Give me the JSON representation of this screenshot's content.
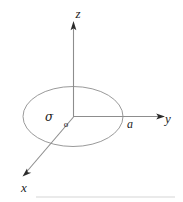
{
  "figure": {
    "background_color": "#ffffff",
    "line_color": "#8d8d8d",
    "outline_color": "#9a9a9a",
    "arrow_color": "#2b2b2b",
    "text_color": "#1c1c1c",
    "baseline_color": "#e3e3e3"
  },
  "axes": {
    "z": {
      "label": "z",
      "label_x": 78,
      "label_y": 18,
      "start_x": 73.5,
      "start_y": 117,
      "end_x": 73.5,
      "end_y": 25,
      "arrow_direction": "up"
    },
    "y": {
      "label": "y",
      "label_x": 168,
      "label_y": 123,
      "start_x": 73.5,
      "start_y": 116.5,
      "end_x": 162,
      "end_y": 116.5,
      "arrow_direction": "right"
    },
    "x": {
      "label": "x",
      "label_x": 24,
      "label_y": 192,
      "start_x": 73.5,
      "start_y": 117,
      "end_x": 24,
      "end_y": 174,
      "arrow_direction": "down-left"
    }
  },
  "origin": {
    "label": "o",
    "label_x": 66,
    "label_y": 127,
    "point_x": 73.5,
    "point_y": 117
  },
  "disk": {
    "name": "charged-disk",
    "center_x": 73,
    "center_y": 116.5,
    "radius_x": 50,
    "radius_y": 30,
    "surface_charge_label": "σ",
    "surface_charge_label_x": 49,
    "surface_charge_label_y": 121,
    "radius_label": "a",
    "radius_label_x": 130,
    "radius_label_y": 128
  },
  "baseline": {
    "name": "bottom-rule",
    "x1": 36,
    "x2": 175,
    "y": 197
  }
}
